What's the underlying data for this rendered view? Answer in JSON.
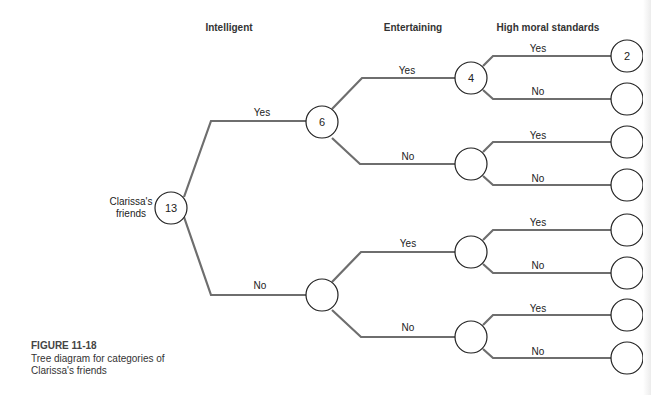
{
  "headers": {
    "level1": "Intelligent",
    "level2": "Entertaining",
    "level3": "High moral standards"
  },
  "root": {
    "label_line1": "Clarissa's",
    "label_line2": "friends",
    "value": "13"
  },
  "nodes": {
    "intelligent_yes": {
      "value": "6"
    },
    "intelligent_no": {
      "value": ""
    },
    "yes_entertaining_yes": {
      "value": "4"
    },
    "yes_entertaining_no": {
      "value": ""
    },
    "no_entertaining_yes": {
      "value": ""
    },
    "no_entertaining_no": {
      "value": ""
    },
    "leaf1": {
      "value": "2"
    },
    "leaf2": {
      "value": ""
    },
    "leaf3": {
      "value": ""
    },
    "leaf4": {
      "value": ""
    },
    "leaf5": {
      "value": ""
    },
    "leaf6": {
      "value": ""
    },
    "leaf7": {
      "value": ""
    },
    "leaf8": {
      "value": ""
    }
  },
  "edge_labels": {
    "yes": "Yes",
    "no": "No"
  },
  "caption": {
    "title": "FIGURE 11-18",
    "line1": "Tree diagram for categories of",
    "line2": "Clarissa's friends"
  },
  "colors": {
    "branch": "#6e6e6e",
    "node_stroke": "#222222"
  }
}
